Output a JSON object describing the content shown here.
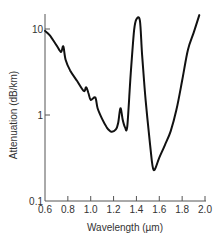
{
  "chart_data": {
    "type": "line",
    "title": "",
    "xlabel": "Wavelength (µm)",
    "ylabel": "Attenuation (dB/km)",
    "x_scale": "linear",
    "y_scale": "log",
    "xlim": [
      0.6,
      2.0
    ],
    "ylim": [
      0.1,
      15
    ],
    "x_ticks": [
      0.6,
      0.8,
      1.0,
      1.2,
      1.4,
      1.6,
      1.8,
      2.0
    ],
    "x_tick_labels": [
      "0.6",
      "0.8",
      "1.0",
      "1.2",
      "1.4",
      "1.6",
      "1.8",
      "2.0"
    ],
    "y_ticks": [
      10,
      1,
      0.1
    ],
    "y_tick_labels": [
      "10",
      "1",
      "0.1"
    ],
    "grid": false,
    "legend": null,
    "series": [
      {
        "name": "Optical fiber attenuation",
        "color": "#111111",
        "x": [
          0.6,
          0.64,
          0.7,
          0.74,
          0.76,
          0.78,
          0.82,
          0.88,
          0.94,
          0.96,
          0.98,
          1.0,
          1.04,
          1.06,
          1.1,
          1.14,
          1.18,
          1.22,
          1.24,
          1.26,
          1.28,
          1.3,
          1.32,
          1.35,
          1.38,
          1.4,
          1.43,
          1.45,
          1.48,
          1.52,
          1.55,
          1.6,
          1.65,
          1.7,
          1.75,
          1.8,
          1.85,
          1.9,
          1.95
        ],
        "y": [
          9.5,
          8.5,
          6.5,
          5.4,
          6.3,
          4.4,
          3.3,
          2.5,
          1.9,
          2.1,
          1.8,
          1.5,
          1.6,
          1.2,
          0.9,
          0.72,
          0.64,
          0.68,
          0.8,
          1.2,
          0.88,
          0.72,
          0.74,
          3.0,
          9.7,
          13.0,
          12.5,
          5.0,
          1.5,
          0.45,
          0.23,
          0.32,
          0.45,
          0.65,
          1.15,
          2.5,
          5.7,
          9.0,
          14.5
        ]
      }
    ]
  }
}
